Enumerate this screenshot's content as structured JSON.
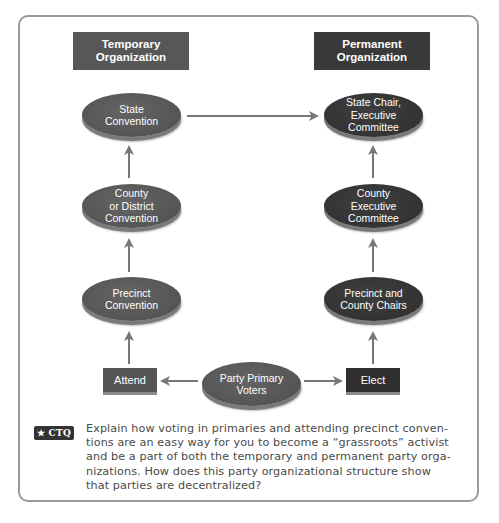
{
  "diagram": {
    "headers": {
      "temporary": "Temporary\nOrganization",
      "permanent": "Permanent\nOrganization"
    },
    "temporary_nodes": [
      {
        "label": "State\nConvention"
      },
      {
        "label": "County\nor District\nConvention"
      },
      {
        "label": "Precinct\nConvention"
      }
    ],
    "permanent_nodes": [
      {
        "label": "State Chair,\nExecutive\nCommittee"
      },
      {
        "label": "County\nExecutive\nCommittee"
      },
      {
        "label": "Precinct and\nCounty Chairs"
      }
    ],
    "source_node": {
      "label": "Party Primary\nVoters"
    },
    "actions": {
      "attend": "Attend",
      "elect": "Elect"
    },
    "arrows": [
      {
        "from": "Party Primary Voters",
        "to": "Attend"
      },
      {
        "from": "Party Primary Voters",
        "to": "Elect"
      },
      {
        "from": "Attend",
        "to": "Precinct Convention"
      },
      {
        "from": "Precinct Convention",
        "to": "County or District Convention"
      },
      {
        "from": "County or District Convention",
        "to": "State Convention"
      },
      {
        "from": "State Convention",
        "to": "State Chair, Executive Committee"
      },
      {
        "from": "Elect",
        "to": "Precinct and County Chairs"
      },
      {
        "from": "Precinct and County Chairs",
        "to": "County Executive Committee"
      }
    ],
    "colors": {
      "temporary_fill": "#555555",
      "permanent_fill": "#333333",
      "arrow": "#777777",
      "frame": "#9a9a9a"
    }
  },
  "ctq": {
    "badge": "★ CTQ",
    "lines": [
      "Explain how voting in primaries and attending precinct conven-",
      "tions are an easy way for you to become a “grassroots” activist",
      "and be a part of both the temporary and permanent party orga-",
      "nizations. How does this party organizational structure show",
      "that parties are decentralized?"
    ]
  }
}
